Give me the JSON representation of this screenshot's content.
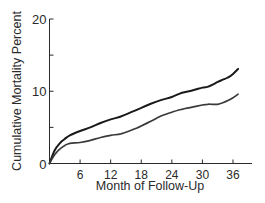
{
  "chart_data": {
    "type": "line",
    "title": "",
    "xlabel": "Month of Follow-Up",
    "ylabel": "Cumulative Mortality Percent",
    "xlim": [
      0,
      38
    ],
    "ylim": [
      0,
      20
    ],
    "x_ticks": [
      6,
      12,
      18,
      24,
      30,
      36
    ],
    "x_tick_labels": [
      "6",
      "12",
      "18",
      "24",
      "30",
      "36"
    ],
    "y_ticks": [
      0,
      5,
      10,
      15,
      20
    ],
    "y_tick_labels": [
      "0",
      "",
      "10",
      "",
      "20"
    ],
    "grid": false,
    "legend": null,
    "x": [
      0,
      1,
      2,
      3,
      4,
      6,
      8,
      10,
      12,
      14,
      16,
      18,
      20,
      22,
      24,
      26,
      28,
      30,
      31,
      32,
      33,
      34,
      35,
      36,
      37
    ],
    "series": [
      {
        "name": "Upper curve",
        "color": "#1a1a1a",
        "values": [
          0,
          1.8,
          2.8,
          3.4,
          3.9,
          4.5,
          5.0,
          5.6,
          6.1,
          6.5,
          7.1,
          7.7,
          8.3,
          8.8,
          9.2,
          9.8,
          10.1,
          10.5,
          10.6,
          10.9,
          11.3,
          11.6,
          11.9,
          12.4,
          13.1
        ]
      },
      {
        "name": "Lower curve",
        "color": "#3a3a3a",
        "values": [
          0,
          1.2,
          2.0,
          2.5,
          2.8,
          2.9,
          3.2,
          3.6,
          3.9,
          4.1,
          4.6,
          5.2,
          5.9,
          6.6,
          7.1,
          7.5,
          7.8,
          8.1,
          8.2,
          8.2,
          8.2,
          8.4,
          8.7,
          9.1,
          9.6
        ]
      }
    ]
  }
}
